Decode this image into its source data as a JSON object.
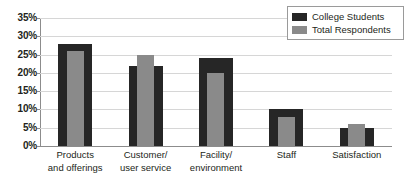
{
  "chart_data": {
    "type": "bar",
    "title": "",
    "subtitle": "",
    "xlabel": "",
    "ylabel": "",
    "ylim": [
      0,
      35
    ],
    "ytick_step": 5,
    "ytick_labels": [
      "35%",
      "30%",
      "25%",
      "20%",
      "15%",
      "10%",
      "5%",
      "0%"
    ],
    "ytick_values": [
      35,
      30,
      25,
      20,
      15,
      10,
      5,
      0
    ],
    "grid": true,
    "grid_axis": "y",
    "legend_position": "top-right",
    "categories": [
      "Products and offerings",
      "Customer/ user service",
      "Facility/ environment",
      "Staff",
      "Satisfaction"
    ],
    "category_lines": [
      [
        "Products",
        "and offerings"
      ],
      [
        "Customer/",
        "user service"
      ],
      [
        "Facility/",
        "environment"
      ],
      [
        "Staff",
        ""
      ],
      [
        "Satisfaction",
        ""
      ]
    ],
    "series": [
      {
        "name": "College Students",
        "color": "#262626",
        "values": [
          28,
          22,
          24,
          10,
          5
        ]
      },
      {
        "name": "Total Respondents",
        "color": "#8a8a8a",
        "values": [
          26,
          25,
          20,
          8,
          6
        ]
      }
    ]
  },
  "legend": {
    "items": [
      {
        "label": "College Students",
        "color": "#262626"
      },
      {
        "label": "Total Respondents",
        "color": "#8a8a8a"
      }
    ]
  },
  "axis": {
    "y_labels": [
      "35%",
      "30%",
      "25%",
      "20%",
      "15%",
      "10%",
      "5%",
      "0%"
    ]
  },
  "colors": {
    "series_dark": "#262626",
    "series_light": "#8a8a8a",
    "gridline": "#d6d6d6",
    "axis": "#8c8c8c",
    "text": "#231f20",
    "background": "#ffffff"
  }
}
